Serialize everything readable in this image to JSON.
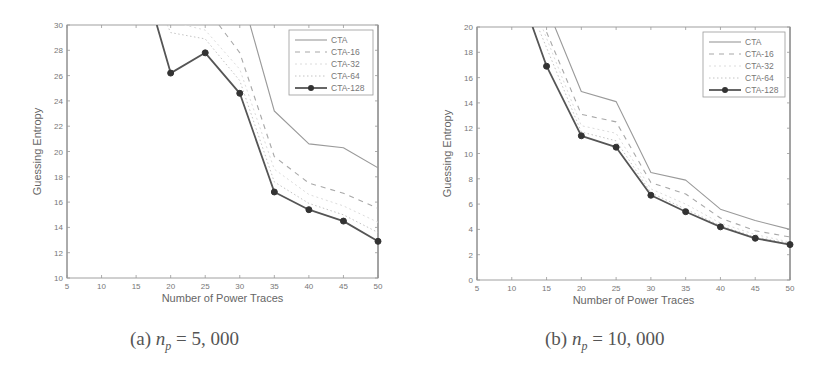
{
  "chart_data": [
    {
      "type": "line",
      "title": "",
      "caption_prefix": "(a)",
      "caption_var": "n",
      "caption_sub": "p",
      "caption_value": "= 5, 000",
      "xlabel": "Number of Power Traces",
      "ylabel": "Guessing Entropy",
      "xlim": [
        5,
        50
      ],
      "ylim": [
        10,
        30
      ],
      "xticks": [
        5,
        10,
        15,
        20,
        25,
        30,
        35,
        40,
        45,
        50
      ],
      "yticks": [
        10,
        12,
        14,
        16,
        18,
        20,
        22,
        24,
        26,
        28,
        30
      ],
      "legend_position": "top-right",
      "grid": false,
      "series": [
        {
          "name": "CTA",
          "style": "solid-light",
          "x": [
            31.5,
            35,
            40,
            45,
            50
          ],
          "y": [
            30,
            23.2,
            20.6,
            20.3,
            18.7
          ]
        },
        {
          "name": "CTA-16",
          "style": "dashed",
          "x": [
            27,
            30,
            35,
            40,
            45,
            50
          ],
          "y": [
            30,
            27.8,
            19.6,
            17.5,
            16.7,
            15.5
          ]
        },
        {
          "name": "CTA-32",
          "style": "dotted-light",
          "x": [
            22,
            25,
            30,
            35,
            40,
            45,
            50
          ],
          "y": [
            30,
            29.6,
            26.5,
            18.6,
            16.6,
            15.7,
            14.4
          ]
        },
        {
          "name": "CTA-64",
          "style": "dotted",
          "x": [
            19.5,
            20,
            25,
            30,
            35,
            40,
            45,
            50
          ],
          "y": [
            30,
            29.4,
            28.9,
            25.6,
            17.6,
            15.9,
            15.0,
            13.6
          ]
        },
        {
          "name": "CTA-128",
          "style": "solid-marker",
          "x": [
            18,
            20,
            25,
            30,
            35,
            40,
            45,
            50
          ],
          "y": [
            30,
            26.2,
            27.8,
            24.6,
            16.8,
            15.4,
            14.5,
            12.9
          ],
          "markers_from_index": 1
        }
      ]
    },
    {
      "type": "line",
      "title": "",
      "caption_prefix": "(b)",
      "caption_var": "n",
      "caption_sub": "p",
      "caption_value": "= 10, 000",
      "xlabel": "Number of Power Traces",
      "ylabel": "Guessing Entropy",
      "xlim": [
        5,
        50
      ],
      "ylim": [
        0,
        20
      ],
      "xticks": [
        5,
        10,
        15,
        20,
        25,
        30,
        35,
        40,
        45,
        50
      ],
      "yticks": [
        0,
        2,
        4,
        6,
        8,
        10,
        12,
        14,
        16,
        18,
        20
      ],
      "legend_position": "top-right",
      "grid": false,
      "series": [
        {
          "name": "CTA",
          "style": "solid-light",
          "x": [
            16.2,
            20,
            25,
            30,
            35,
            40,
            45,
            50
          ],
          "y": [
            20,
            14.9,
            14.1,
            8.5,
            7.9,
            5.6,
            4.7,
            4.0
          ]
        },
        {
          "name": "CTA-16",
          "style": "dashed",
          "x": [
            15,
            20,
            25,
            30,
            35,
            40,
            45,
            50
          ],
          "y": [
            19.6,
            13.1,
            12.5,
            7.7,
            6.8,
            4.9,
            3.9,
            3.4
          ]
        },
        {
          "name": "CTA-32",
          "style": "dotted-light",
          "x": [
            14.5,
            20,
            25,
            30,
            35,
            40,
            45,
            50
          ],
          "y": [
            19.8,
            12.2,
            11.6,
            7.2,
            6.0,
            4.5,
            3.6,
            3.0
          ]
        },
        {
          "name": "CTA-64",
          "style": "dotted",
          "x": [
            14,
            20,
            25,
            30,
            35,
            40,
            45,
            50
          ],
          "y": [
            19.7,
            11.7,
            11.0,
            6.9,
            5.6,
            4.3,
            3.4,
            2.9
          ]
        },
        {
          "name": "CTA-128",
          "style": "solid-marker",
          "x": [
            13,
            15,
            20,
            25,
            30,
            35,
            40,
            45,
            50
          ],
          "y": [
            20,
            16.9,
            11.4,
            10.5,
            6.7,
            5.4,
            4.2,
            3.3,
            2.8
          ],
          "markers_from_index": 1
        }
      ]
    }
  ]
}
